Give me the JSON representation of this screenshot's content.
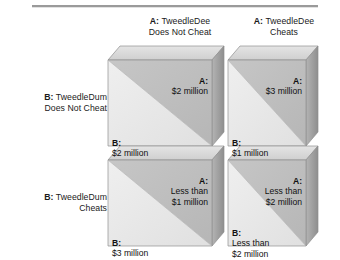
{
  "diagram": {
    "type": "payoff-matrix-2x2",
    "title_rule": "horizontal-rule",
    "column_headers": [
      {
        "player": "A:",
        "name": "TweedleDee",
        "action": "Does Not Cheat"
      },
      {
        "player": "A:",
        "name": "TweedleDee",
        "action": "Cheats"
      }
    ],
    "row_headers": [
      {
        "player": "B:",
        "name": "TweedleDum",
        "action": "Does Not Cheat"
      },
      {
        "player": "B:",
        "name": "TweedleDum",
        "action": "Cheats"
      }
    ],
    "cells": [
      {
        "id": "cell-r1c1",
        "a_label": "A:",
        "a_payoff": "$2 million",
        "b_label": "B:",
        "b_payoff": "$2 million"
      },
      {
        "id": "cell-r1c2",
        "a_label": "A:",
        "a_payoff": "$3 million",
        "b_label": "B:",
        "b_payoff": "$1 million"
      },
      {
        "id": "cell-r2c1",
        "a_label": "A:",
        "a_payoff": "Less than\n$1 million",
        "b_label": "B:",
        "b_payoff": "$3 million"
      },
      {
        "id": "cell-r2c2",
        "a_label": "A:",
        "a_payoff": "Less than\n$2 million",
        "b_label": "B:",
        "b_payoff": "Less than\n$2 million"
      }
    ],
    "colors": {
      "background": "#ffffff",
      "face_upper_triangle": "#bfbfbf",
      "face_lower_triangle": "#e9e9e9",
      "bevel_top": "#d6d6d6",
      "bevel_side": "#a9a9a9",
      "outline": "#8f8f8f",
      "rule": "#9a9a9a",
      "text": "#1a1a1a"
    }
  }
}
